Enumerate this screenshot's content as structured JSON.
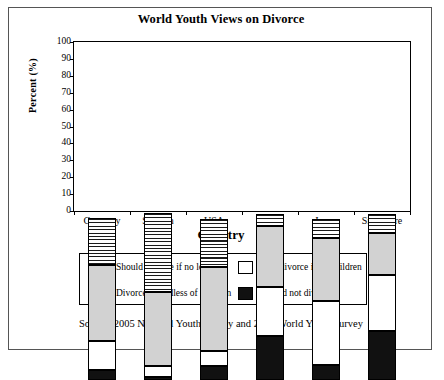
{
  "chart_data": {
    "type": "bar",
    "subtype": "stacked-bar",
    "title": "World Youth Views on Divorce",
    "xlabel": "Country",
    "ylabel": "Percent (%)",
    "ylim": [
      0,
      100
    ],
    "yticks": [
      0,
      10,
      20,
      30,
      40,
      50,
      60,
      70,
      80,
      90,
      100
    ],
    "grid": false,
    "legend_position": "bottom",
    "categories": [
      "Germany",
      "Sweden",
      "USA",
      "Korea",
      "Japan",
      "Singapore"
    ],
    "series": [
      {
        "name": "Should not divorce",
        "swatch": "black",
        "color": "#111111",
        "values": [
          6,
          2,
          8,
          26,
          9,
          29
        ]
      },
      {
        "name": "May divorce if no children",
        "swatch": "white",
        "color": "#ffffff",
        "values": [
          17,
          6,
          9,
          29,
          38,
          33
        ]
      },
      {
        "name": "Divorce regardless of children",
        "swatch": "grey",
        "color": "#d2d2d2",
        "values": [
          45,
          44,
          50,
          36,
          37,
          25
        ]
      },
      {
        "name": "Should divorce if no love",
        "swatch": "striped",
        "color": "#1a1a1a",
        "values": [
          28,
          47,
          28,
          7,
          11,
          11
        ]
      }
    ],
    "segment_tops": {
      "Germany": [
        6,
        23,
        68,
        96
      ],
      "Sweden": [
        2,
        8,
        52,
        99
      ],
      "USA": [
        8,
        17,
        67,
        95
      ],
      "Korea": [
        26,
        55,
        91,
        98
      ],
      "Japan": [
        9,
        47,
        84,
        95
      ],
      "Singapore": [
        29,
        62,
        87,
        98
      ]
    },
    "source": "Source: 2005 National Youth Survey and 2003 World Youth Survey"
  },
  "legend": {
    "items": [
      {
        "label": "Should divorce if no love",
        "swatch": "striped"
      },
      {
        "label": "May divorce if no children",
        "swatch": "white"
      },
      {
        "label": "Divorce regardless of children",
        "swatch": "grey"
      },
      {
        "label": "Should not divorce",
        "swatch": "black"
      }
    ]
  }
}
